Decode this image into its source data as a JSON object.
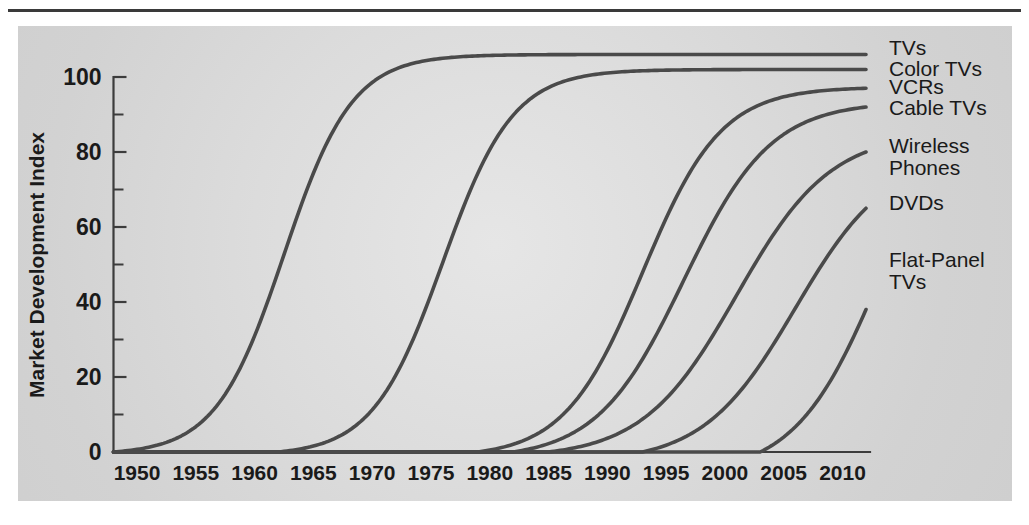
{
  "chart_data": {
    "type": "line",
    "title": "",
    "subtitle": "",
    "xlabel": "",
    "ylabel": "Market Development Index",
    "xlim": [
      1948,
      2013
    ],
    "ylim": [
      0,
      107
    ],
    "grid": false,
    "legend_position": "right-inline-labels",
    "x_ticks": [
      1950,
      1955,
      1960,
      1965,
      1970,
      1975,
      1980,
      1985,
      1990,
      1995,
      2000,
      2005,
      2010
    ],
    "x_tick_labels": [
      "1950",
      "1955",
      "1960",
      "1965",
      "1970",
      "1975",
      "1980",
      "1985",
      "1990",
      "1995",
      "2000",
      "2005",
      "2010"
    ],
    "y_ticks_major": [
      0,
      20,
      40,
      60,
      80,
      100
    ],
    "y_tick_labels": [
      "0",
      "20",
      "40",
      "60",
      "80",
      "100"
    ],
    "y_ticks_minor": [
      10,
      30,
      50,
      70,
      90
    ],
    "line_color": "#4a4a4a",
    "axis_color": "#3c3c3c",
    "panel_color": "#d9d9d9",
    "series": [
      {
        "name": "TVs",
        "label": "TVs",
        "start_year": 1948,
        "midpoint_year": 1962.5,
        "growth_rate": 0.345,
        "ceiling": 106,
        "end_year": 2012,
        "end_value": 106,
        "label_x": 1963,
        "label_y": 55
      },
      {
        "name": "Color TVs",
        "label": "Color TVs",
        "start_year": 1962,
        "midpoint_year": 1976.0,
        "growth_rate": 0.335,
        "ceiling": 102,
        "end_year": 2012,
        "end_value": 102,
        "label_x": 1963,
        "label_y": 75
      },
      {
        "name": "VCRs",
        "label": "VCRs",
        "start_year": 1979,
        "midpoint_year": 1993.0,
        "growth_rate": 0.3,
        "ceiling": 97,
        "end_year": 2012,
        "end_value": 97,
        "label_x": 1963,
        "label_y": 93
      },
      {
        "name": "Cable TVs",
        "label": "Cable TVs",
        "start_year": 1982,
        "midpoint_year": 1996.5,
        "growth_rate": 0.27,
        "ceiling": 93,
        "end_year": 2012,
        "end_value": 92,
        "label_x": 1963,
        "label_y": 114
      },
      {
        "name": "Wireless Phones",
        "label": "Wireless",
        "label2": "Phones",
        "start_year": 1985,
        "midpoint_year": 2001.0,
        "growth_rate": 0.25,
        "ceiling": 85,
        "end_year": 2012,
        "end_value": 80,
        "label_x": 1963,
        "label_y": 152
      },
      {
        "name": "DVDs",
        "label": "DVDs",
        "start_year": 1993,
        "midpoint_year": 2006.0,
        "growth_rate": 0.255,
        "ceiling": 78,
        "end_year": 2012,
        "end_value": 65,
        "label_x": 1963,
        "label_y": 209
      },
      {
        "name": "Flat-Panel TVs",
        "label": "Flat-Panel",
        "label2": "TVs",
        "start_year": 2003,
        "midpoint_year": 2013.5,
        "growth_rate": 0.27,
        "ceiling": 72,
        "end_year": 2012,
        "end_value": 38,
        "label_x": 1963,
        "label_y": 266
      }
    ]
  },
  "axes": {
    "y_axis_title": "Market Development Index"
  },
  "labels": {
    "series_labels": [
      {
        "text": "TVs",
        "y": 55
      },
      {
        "text": "Color TVs",
        "y": 76
      },
      {
        "text": "VCRs",
        "y": 94
      },
      {
        "text": "Cable TVs",
        "y": 115
      },
      {
        "text": "Wireless",
        "y": 153
      },
      {
        "text": "Phones",
        "y": 175
      },
      {
        "text": "DVDs",
        "y": 210
      },
      {
        "text": "Flat-Panel",
        "y": 267
      },
      {
        "text": "TVs",
        "y": 289
      }
    ]
  }
}
